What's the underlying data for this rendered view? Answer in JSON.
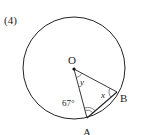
{
  "problem_number": "(4)",
  "points": {
    "O": {
      "label": "O",
      "x": 74,
      "y": 69
    },
    "A": {
      "label": "A",
      "x": 87,
      "y": 118
    },
    "B": {
      "label": "B",
      "x": 117,
      "y": 92
    }
  },
  "circle": {
    "cx": 74,
    "cy": 68,
    "r": 51
  },
  "angles": {
    "given": "67°",
    "x": "x",
    "y": "y"
  },
  "colors": {
    "stroke": "#222222",
    "background": "#ffffff"
  }
}
